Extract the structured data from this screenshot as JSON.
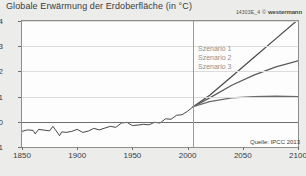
{
  "title": "Globale Erwärmung der Erdoberfläche (in °C)",
  "credit": {
    "code": "14303E_4",
    "copyright": "©",
    "brand": "westermann"
  },
  "source": "Quelle: IPCC 2013",
  "legend": {
    "items": [
      "Szenario 1",
      "Szenario 2",
      "Szenario 3"
    ]
  },
  "chart_data": {
    "type": "line",
    "title": "Globale Erwärmung der Erdoberfläche (in °C)",
    "xlabel": "",
    "ylabel": "°C",
    "xlim": [
      1850,
      2100
    ],
    "ylim": [
      -1,
      4
    ],
    "xticks": [
      1850,
      1900,
      1950,
      2000,
      2050,
      2100
    ],
    "yticks": [
      -1,
      0,
      1,
      2,
      3,
      4
    ],
    "grid": true,
    "legend_position": "inside-upper-center",
    "annotations": [
      "Quelle: IPCC 2013"
    ],
    "reference_line_x": 2005,
    "series": [
      {
        "name": "Beobachtung",
        "color": "#333333",
        "x": [
          1850,
          1855,
          1860,
          1862,
          1865,
          1870,
          1875,
          1878,
          1880,
          1884,
          1886,
          1890,
          1895,
          1900,
          1905,
          1910,
          1915,
          1920,
          1925,
          1930,
          1935,
          1940,
          1945,
          1950,
          1955,
          1960,
          1965,
          1970,
          1975,
          1980,
          1985,
          1990,
          1995,
          2000,
          2005
        ],
        "y": [
          -0.38,
          -0.32,
          -0.34,
          -0.48,
          -0.3,
          -0.33,
          -0.36,
          -0.18,
          -0.3,
          -0.55,
          -0.4,
          -0.42,
          -0.38,
          -0.3,
          -0.42,
          -0.37,
          -0.26,
          -0.32,
          -0.25,
          -0.18,
          -0.22,
          -0.05,
          -0.02,
          -0.15,
          -0.13,
          -0.1,
          -0.12,
          -0.02,
          -0.05,
          0.12,
          0.1,
          0.26,
          0.28,
          0.42,
          0.6
        ]
      },
      {
        "name": "Szenario 1",
        "color": "#4a4a4a",
        "x": [
          2005,
          2020,
          2040,
          2060,
          2080,
          2100
        ],
        "y": [
          0.6,
          1.05,
          1.8,
          2.55,
          3.3,
          4.05
        ]
      },
      {
        "name": "Szenario 2",
        "color": "#5a5a5a",
        "x": [
          2005,
          2020,
          2040,
          2060,
          2080,
          2100
        ],
        "y": [
          0.6,
          0.95,
          1.45,
          1.85,
          2.18,
          2.42
        ]
      },
      {
        "name": "Szenario 3",
        "color": "#6a6a6a",
        "x": [
          2005,
          2020,
          2040,
          2060,
          2080,
          2100
        ],
        "y": [
          0.6,
          0.8,
          0.95,
          1.0,
          1.02,
          1.0
        ]
      }
    ]
  }
}
